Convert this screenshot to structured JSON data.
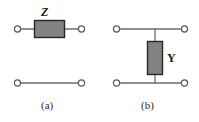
{
  "figure": {
    "kind": "circuit-diagram",
    "background_color": "#ffffff",
    "panels": [
      {
        "id": "a",
        "caption": "(a)",
        "element_label": "Z",
        "element_type": "series-impedance-box",
        "description": "Two-port with series impedance Z in the top branch and a plain wire in the bottom branch",
        "terminals": 4
      },
      {
        "id": "b",
        "caption": "(b)",
        "element_label": "Y",
        "element_type": "shunt-admittance-box",
        "description": "Two-port with shunt admittance Y bridging the top and bottom branches",
        "terminals": 4
      }
    ]
  },
  "colors": {
    "box_fill": "#828282",
    "box_stroke": "#262626",
    "wire": "#6e6e6e",
    "terminal_stroke": "#5a5a5a",
    "terminal_fill": "#ffffff",
    "text": "#1a1a1a",
    "caption": "#2b2b2b"
  },
  "panel_a": {
    "label": "Z",
    "caption": "(a)",
    "top_wire": {
      "x1": 21,
      "y1": 29,
      "x2": 77,
      "y2": 29
    },
    "bottom_wire": {
      "x1": 21,
      "y1": 83,
      "x2": 77,
      "y2": 83
    },
    "box": {
      "x": 34,
      "y": 20,
      "width": 31,
      "height": 18
    },
    "terminals": [
      {
        "name": "top-left",
        "cx": 17,
        "cy": 29,
        "r": 3.2
      },
      {
        "name": "top-right",
        "cx": 81,
        "cy": 29,
        "r": 3.2
      },
      {
        "name": "bottom-left",
        "cx": 17,
        "cy": 83,
        "r": 3.2
      },
      {
        "name": "bottom-right",
        "cx": 81,
        "cy": 83,
        "r": 3.2
      }
    ]
  },
  "panel_b": {
    "label": "Y",
    "caption": "(b)",
    "top_wire": {
      "x1": 120,
      "y1": 29,
      "x2": 180,
      "y2": 29
    },
    "bottom_wire": {
      "x1": 120,
      "y1": 83,
      "x2": 180,
      "y2": 83
    },
    "shunt_wire": {
      "x1": 155,
      "y1": 29,
      "x2": 155,
      "y2": 83
    },
    "box": {
      "x": 147,
      "y": 41,
      "width": 16,
      "height": 34
    },
    "terminals": [
      {
        "name": "top-left",
        "cx": 116,
        "cy": 29,
        "r": 3.2
      },
      {
        "name": "top-right",
        "cx": 184,
        "cy": 29,
        "r": 3.2
      },
      {
        "name": "bottom-left",
        "cx": 116,
        "cy": 83,
        "r": 3.2
      },
      {
        "name": "bottom-right",
        "cx": 184,
        "cy": 83,
        "r": 3.2
      }
    ]
  }
}
